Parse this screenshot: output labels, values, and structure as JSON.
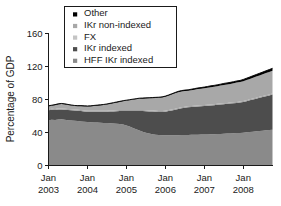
{
  "chart_data": {
    "type": "area",
    "stacked": true,
    "title": "",
    "xlabel": "",
    "ylabel": "Percentage of GDP",
    "ylim": [
      0,
      160
    ],
    "yticks": [
      0,
      40,
      80,
      120,
      160
    ],
    "ytick_labels": [
      "0",
      "40",
      "80",
      "120",
      "160"
    ],
    "grid": false,
    "legend_position": "top-center",
    "xtick_labels": [
      {
        "month": "Jan",
        "year": "2003"
      },
      {
        "month": "Jan",
        "year": "2004"
      },
      {
        "month": "Jan",
        "year": "2005"
      },
      {
        "month": "Jan",
        "year": "2006"
      },
      {
        "month": "Jan",
        "year": "2007"
      },
      {
        "month": "Jan",
        "year": "2008"
      }
    ],
    "x": [
      2003.0,
      2003.083,
      2003.167,
      2003.25,
      2003.333,
      2003.417,
      2003.5,
      2003.583,
      2003.667,
      2003.75,
      2003.833,
      2003.917,
      2004.0,
      2004.083,
      2004.167,
      2004.25,
      2004.333,
      2004.417,
      2004.5,
      2004.583,
      2004.667,
      2004.75,
      2004.833,
      2004.917,
      2005.0,
      2005.083,
      2005.167,
      2005.25,
      2005.333,
      2005.417,
      2005.5,
      2005.583,
      2005.667,
      2005.75,
      2005.833,
      2005.917,
      2006.0,
      2006.083,
      2006.167,
      2006.25,
      2006.333,
      2006.417,
      2006.5,
      2006.583,
      2006.667,
      2006.75,
      2006.833,
      2006.917,
      2007.0,
      2007.083,
      2007.167,
      2007.25,
      2007.333,
      2007.417,
      2007.5,
      2007.583,
      2007.667,
      2007.75,
      2007.833,
      2007.917,
      2008.0,
      2008.083,
      2008.167,
      2008.25,
      2008.333,
      2008.417,
      2008.5,
      2008.583,
      2008.667,
      2008.75
    ],
    "series": [
      {
        "name": "HFF IKr indexed",
        "color": "#8a8a8a",
        "values": [
          55.0,
          55.5,
          55.2,
          55.8,
          56.0,
          55.6,
          55.0,
          54.6,
          54.2,
          53.8,
          53.4,
          53.0,
          52.6,
          52.4,
          52.2,
          52.0,
          51.8,
          51.6,
          51.4,
          51.2,
          51.0,
          50.6,
          50.2,
          49.6,
          48.6,
          47.2,
          45.6,
          44.0,
          42.4,
          41.0,
          39.8,
          38.8,
          38.0,
          37.4,
          37.0,
          36.8,
          36.6,
          36.6,
          36.6,
          36.7,
          36.8,
          36.9,
          37.0,
          37.1,
          37.2,
          37.3,
          37.4,
          37.5,
          37.6,
          37.7,
          37.8,
          37.9,
          38.1,
          38.3,
          38.5,
          38.7,
          38.9,
          39.1,
          39.3,
          39.5,
          39.8,
          40.2,
          40.6,
          41.0,
          41.4,
          41.8,
          42.2,
          42.6,
          43.0,
          43.4
        ]
      },
      {
        "name": "IKr indexed",
        "color": "#4d4d4d",
        "values": [
          12.0,
          12.0,
          12.2,
          12.0,
          11.8,
          12.0,
          12.2,
          12.4,
          12.6,
          12.6,
          12.6,
          12.6,
          12.6,
          12.8,
          13.0,
          13.2,
          13.4,
          13.6,
          13.8,
          14.2,
          14.6,
          15.2,
          15.8,
          16.6,
          17.6,
          19.0,
          20.6,
          22.2,
          23.8,
          25.0,
          26.0,
          26.8,
          27.4,
          27.8,
          28.0,
          28.2,
          28.6,
          29.4,
          30.2,
          31.0,
          31.8,
          32.4,
          33.0,
          33.4,
          33.8,
          34.0,
          34.2,
          34.4,
          34.6,
          34.8,
          35.0,
          35.2,
          35.4,
          35.6,
          35.8,
          36.0,
          36.2,
          36.4,
          36.6,
          36.8,
          37.2,
          37.8,
          38.4,
          39.0,
          39.6,
          40.2,
          40.8,
          41.4,
          42.0,
          42.6
        ]
      },
      {
        "name": "FX",
        "color": "#9f9f9f",
        "values": [
          1.2,
          1.2,
          1.2,
          1.2,
          1.2,
          1.2,
          1.2,
          1.2,
          1.2,
          1.2,
          1.2,
          1.2,
          1.2,
          1.2,
          1.2,
          1.2,
          1.2,
          1.2,
          1.2,
          1.2,
          1.2,
          1.2,
          1.2,
          1.2,
          1.2,
          1.2,
          1.2,
          1.2,
          1.2,
          1.2,
          1.2,
          1.2,
          1.2,
          1.2,
          1.2,
          1.2,
          1.2,
          1.2,
          1.2,
          1.2,
          1.2,
          1.2,
          1.2,
          1.2,
          1.2,
          1.2,
          1.2,
          1.2,
          1.2,
          1.2,
          1.2,
          1.2,
          1.2,
          1.2,
          1.2,
          1.2,
          1.2,
          1.2,
          1.2,
          1.2,
          1.2,
          1.2,
          1.2,
          1.2,
          1.2,
          1.2,
          1.2,
          1.2,
          1.2,
          1.2
        ]
      },
      {
        "name": "IKr non-indexed",
        "color": "#a8a8a8",
        "values": [
          3.4,
          3.6,
          4.4,
          5.0,
          5.4,
          5.2,
          4.8,
          4.4,
          4.0,
          4.2,
          4.6,
          4.8,
          5.0,
          5.2,
          5.6,
          6.0,
          6.4,
          6.8,
          7.4,
          8.0,
          8.6,
          9.2,
          9.8,
          10.4,
          11.0,
          11.6,
          12.2,
          12.8,
          13.4,
          13.8,
          14.2,
          14.6,
          15.0,
          15.4,
          15.8,
          16.2,
          16.8,
          17.4,
          18.0,
          18.6,
          19.0,
          19.2,
          19.0,
          18.8,
          19.0,
          19.4,
          19.8,
          20.0,
          20.2,
          20.6,
          21.0,
          21.2,
          21.4,
          21.8,
          22.2,
          22.4,
          22.6,
          23.0,
          23.4,
          23.6,
          24.0,
          24.4,
          24.8,
          25.2,
          25.6,
          26.0,
          26.4,
          26.8,
          27.2,
          27.6
        ]
      },
      {
        "name": "Other",
        "color": "#000000",
        "values": [
          0.8,
          0.8,
          0.8,
          0.8,
          0.8,
          0.8,
          0.8,
          0.8,
          0.8,
          0.8,
          0.8,
          0.8,
          0.8,
          0.8,
          0.8,
          0.8,
          0.8,
          0.8,
          0.8,
          0.8,
          0.8,
          0.8,
          0.8,
          0.8,
          0.8,
          0.8,
          0.8,
          0.8,
          0.8,
          0.8,
          0.8,
          0.8,
          0.8,
          0.8,
          0.8,
          0.8,
          0.9,
          0.9,
          1.0,
          1.0,
          1.1,
          1.1,
          1.2,
          1.2,
          1.3,
          1.3,
          1.4,
          1.4,
          1.5,
          1.5,
          1.6,
          1.6,
          1.7,
          1.7,
          1.8,
          1.8,
          1.9,
          1.9,
          2.0,
          2.0,
          2.1,
          2.2,
          2.3,
          2.4,
          2.5,
          2.6,
          2.7,
          2.8,
          2.9,
          3.0
        ]
      }
    ],
    "legend": [
      {
        "label": "Other",
        "color": "#000000",
        "swatch": "legend-swatch-other"
      },
      {
        "label": "IKr non-indexed",
        "color": "#a8a8a8",
        "swatch": "legend-swatch-ikr-non-indexed"
      },
      {
        "label": "FX",
        "color": "#c4c4c4",
        "swatch": "legend-swatch-fx"
      },
      {
        "label": "IKr indexed",
        "color": "#4d4d4d",
        "swatch": "legend-swatch-ikr-indexed"
      },
      {
        "label": "HFF IKr indexed",
        "color": "#8a8a8a",
        "swatch": "legend-swatch-hff-ikr-indexed"
      }
    ]
  }
}
